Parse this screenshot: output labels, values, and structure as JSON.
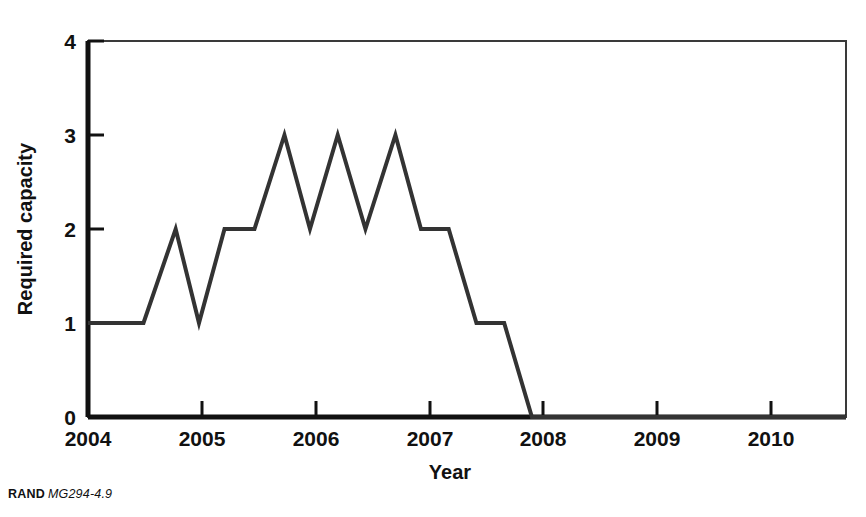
{
  "credit": {
    "brand": "RAND",
    "identifier": "MG294-4.9"
  },
  "chart_data": {
    "type": "line",
    "title": "",
    "xlabel": "Year",
    "ylabel": "Required capacity",
    "xlim": [
      2004,
      2010.83
    ],
    "ylim": [
      0,
      4
    ],
    "grid": false,
    "legend": false,
    "xticks": [
      2004,
      2005,
      2006,
      2007,
      2008,
      2009,
      2010
    ],
    "xtick_labels": [
      "2004",
      "2005",
      "2006",
      "2007",
      "2008",
      "2009",
      "2010"
    ],
    "yticks": [
      0,
      1,
      2,
      3,
      4
    ],
    "ytick_labels": [
      "0",
      "1",
      "2",
      "3",
      "4"
    ],
    "series": [
      {
        "name": "Required capacity",
        "color": "#333333",
        "linewidth": 4,
        "x": [
          2004.0,
          2004.5,
          2004.79,
          2005.0,
          2005.23,
          2005.5,
          2005.77,
          2006.0,
          2006.25,
          2006.5,
          2006.77,
          2007.0,
          2007.25,
          2007.5,
          2007.75,
          2008.0,
          2010.83
        ],
        "y": [
          1,
          1,
          2,
          1,
          2,
          2,
          3,
          2,
          3,
          2,
          3,
          2,
          2,
          1,
          1,
          0,
          0
        ]
      }
    ]
  }
}
